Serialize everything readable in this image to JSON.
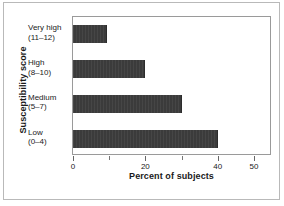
{
  "chart_data": {
    "type": "bar",
    "orientation": "horizontal",
    "title": "",
    "xlabel": "Percent of subjects",
    "ylabel": "Susceptibility score",
    "categories": [
      {
        "line1": "Very high",
        "line2": "(11–12)",
        "value": 9.5
      },
      {
        "line1": "High",
        "line2": "(8–10)",
        "value": 20
      },
      {
        "line1": "Medium",
        "line2": "(5–7)",
        "value": 30
      },
      {
        "line1": "Low",
        "line2": "(0–4)",
        "value": 40
      }
    ],
    "values": [
      9.5,
      20,
      30,
      40
    ],
    "xlim": [
      0,
      55
    ],
    "xticks": [
      {
        "value": 0,
        "label": "0",
        "major": true
      },
      {
        "value": 10,
        "label": "",
        "major": false
      },
      {
        "value": 20,
        "label": "20",
        "major": true
      },
      {
        "value": 30,
        "label": "",
        "major": false
      },
      {
        "value": 40,
        "label": "40",
        "major": true
      },
      {
        "value": 50,
        "label": "50",
        "major": true
      }
    ],
    "grid": false,
    "legend": null,
    "bar_color": "#3b3b3b",
    "plot_background": "#ffffff",
    "frame_color": "#b9b9b9"
  }
}
